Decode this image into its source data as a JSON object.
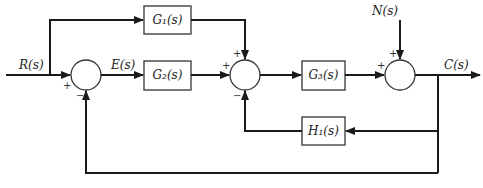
{
  "diagram": {
    "type": "control-system-block-diagram",
    "signals": {
      "input": "R(s)",
      "error": "E(s)",
      "disturbance": "N(s)",
      "output": "C(s)"
    },
    "blocks": {
      "g1": "G₁(s)",
      "g2": "G₂(s)",
      "g3": "G₃(s)",
      "h1": "H₁(s)"
    },
    "summing_junctions": {
      "sum1": {
        "signs": {
          "left": "+",
          "bottom": "−"
        }
      },
      "sum2": {
        "signs": {
          "left": "+",
          "top": "+",
          "bottom": "−"
        }
      },
      "sum3": {
        "signs": {
          "left": "+",
          "top": "+"
        }
      }
    }
  }
}
